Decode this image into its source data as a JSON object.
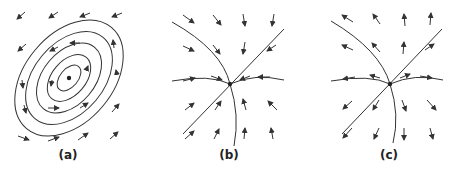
{
  "figure": {
    "panels": [
      {
        "id": "a",
        "label": "(a)",
        "type": "center",
        "description": "Closed elliptical orbits around an equilibrium point (center), counter-clockwise flow",
        "center": [
          69,
          78
        ]
      },
      {
        "id": "b",
        "label": "(b)",
        "type": "stable-node",
        "description": "Trajectories converge into the equilibrium point (stable node)",
        "center": [
          230,
          84
        ]
      },
      {
        "id": "c",
        "label": "(c)",
        "type": "unstable-node",
        "description": "Trajectories diverge from the equilibrium point (unstable node)",
        "center": [
          390,
          84
        ]
      }
    ],
    "colors": {
      "stroke": "#333333",
      "background": "#ffffff"
    }
  }
}
